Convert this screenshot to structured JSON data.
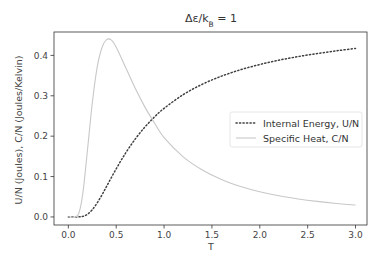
{
  "chart_data": {
    "type": "line",
    "title_parts": {
      "main": "Δε/k",
      "sub": "B",
      "tail": " = 1"
    },
    "xlabel": "T",
    "ylabel": "U/N (Joules), C/N (Joules/Kelvin)",
    "xlim": [
      -0.15,
      3.12
    ],
    "ylim": [
      -0.02,
      0.458
    ],
    "xticks": [
      0.0,
      0.5,
      1.0,
      1.5,
      2.0,
      2.5,
      3.0
    ],
    "xtick_labels": [
      "0.0",
      "0.5",
      "1.0",
      "1.5",
      "2.0",
      "2.5",
      "3.0"
    ],
    "yticks": [
      0.0,
      0.1,
      0.2,
      0.3,
      0.4
    ],
    "ytick_labels": [
      "0.0",
      "0.1",
      "0.2",
      "0.3",
      "0.4"
    ],
    "grid": false,
    "legend_position": "center-right",
    "series": [
      {
        "name": "Internal Energy, U/N",
        "style": "dotted",
        "color": "#404040",
        "x": [
          0.0,
          0.1,
          0.15,
          0.2,
          0.25,
          0.3,
          0.35,
          0.4,
          0.5,
          0.6,
          0.7,
          0.8,
          0.9,
          1.0,
          1.2,
          1.4,
          1.6,
          1.8,
          2.0,
          2.2,
          2.4,
          2.6,
          2.8,
          3.0
        ],
        "values": [
          0.0,
          5e-05,
          0.0013,
          0.0067,
          0.018,
          0.0344,
          0.054,
          0.0759,
          0.1192,
          0.1589,
          0.1933,
          0.2227,
          0.2477,
          0.2689,
          0.3029,
          0.3287,
          0.3486,
          0.3646,
          0.3775,
          0.3882,
          0.3971,
          0.4047,
          0.4113,
          0.4174
        ]
      },
      {
        "name": "Specific Heat, C/N",
        "style": "solid",
        "color": "#c8c8c8",
        "x": [
          0.0,
          0.1,
          0.15,
          0.2,
          0.25,
          0.3,
          0.35,
          0.4,
          0.45,
          0.5,
          0.6,
          0.7,
          0.8,
          0.9,
          1.0,
          1.2,
          1.4,
          1.6,
          1.8,
          2.0,
          2.2,
          2.4,
          2.6,
          2.8,
          3.0
        ],
        "values": [
          0.0,
          0.0045,
          0.0566,
          0.1663,
          0.2823,
          0.3693,
          0.4184,
          0.4392,
          0.4379,
          0.42,
          0.3695,
          0.318,
          0.2719,
          0.2326,
          0.1966,
          0.1489,
          0.1163,
          0.0927,
          0.0754,
          0.0624,
          0.0524,
          0.0446,
          0.0384,
          0.0334,
          0.0294
        ]
      }
    ]
  }
}
